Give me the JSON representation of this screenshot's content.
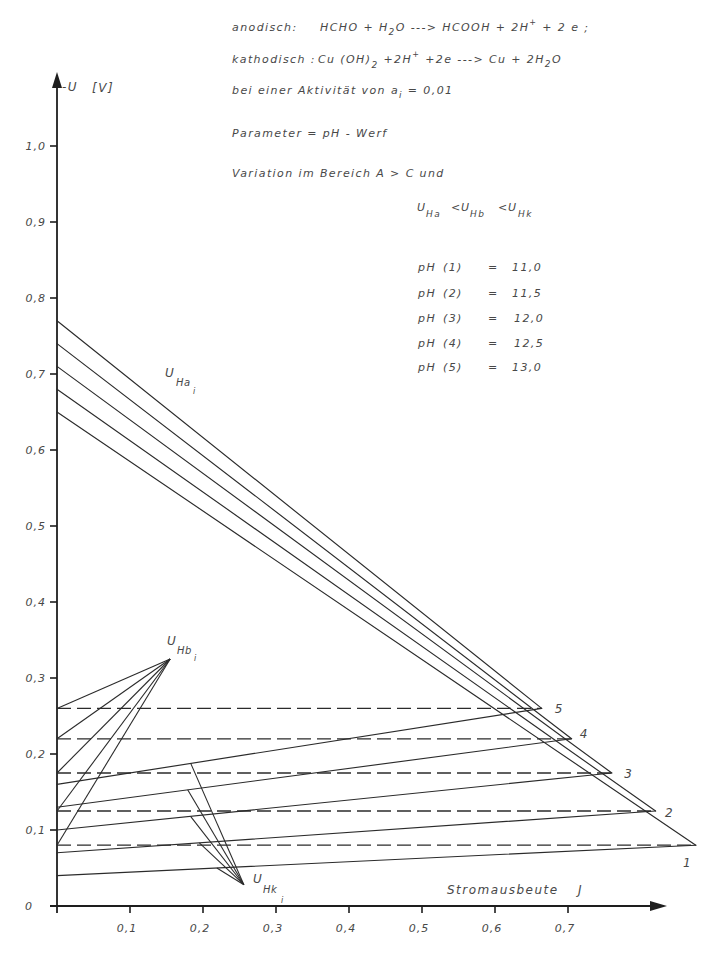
{
  "header": {
    "anodic": {
      "label": "anodisch:",
      "p1": "HCHO + H",
      "s1": "2",
      "p2": "O ---> HCOOH + 2H",
      "sup1": "+",
      "p3": " + 2 e ;"
    },
    "cathodic": {
      "label": "kathodisch :",
      "p1": "Cu (OH)",
      "s1": "2",
      "p2": " +2H",
      "sup1": "+",
      "p3": " +2e ---> Cu + 2H",
      "s2": "2",
      "p4": "O"
    },
    "activity": {
      "p1": "bei einer Aktivität von a",
      "s1": "i",
      "p2": " = 0,01"
    },
    "parameter": "Parameter = pH - Werf",
    "variation": "Variation im Bereich A > C und",
    "order": {
      "u1": "U",
      "s1": "Ha",
      "op1": "<",
      "u2": "U",
      "s2": "Hb",
      "op2": "<",
      "u3": "U",
      "s3": "Hk"
    }
  },
  "ph_table": [
    {
      "label": "pH",
      "index": "(1)",
      "eq": "=",
      "value": "11,0"
    },
    {
      "label": "pH",
      "index": "(2)",
      "eq": "=",
      "value": "11,5"
    },
    {
      "label": "pH",
      "index": "(3)",
      "eq": "=",
      "value": "12,0"
    },
    {
      "label": "pH",
      "index": "(4)",
      "eq": "=",
      "value": "12,5"
    },
    {
      "label": "pH",
      "index": "(5)",
      "eq": "=",
      "value": "13,0"
    }
  ],
  "chart_data": {
    "type": "line",
    "title": "",
    "xlabel": "Stromausbeute J",
    "xlabel_parts": {
      "text": "Stromausbeute",
      "symbol": "J"
    },
    "ylabel": "-U [V]",
    "ylabel_parts": {
      "symbol": "-U",
      "unit": "[V]"
    },
    "origin_label": "0",
    "xlim": [
      0,
      0.83
    ],
    "ylim": [
      0,
      1.09
    ],
    "grid": false,
    "legend": null,
    "x_ticks": [
      {
        "v": 0.1,
        "label": "0,1"
      },
      {
        "v": 0.2,
        "label": "0,2"
      },
      {
        "v": 0.3,
        "label": "0,3"
      },
      {
        "v": 0.4,
        "label": "0,4"
      },
      {
        "v": 0.5,
        "label": "0,5"
      },
      {
        "v": 0.6,
        "label": "0,6"
      },
      {
        "v": 0.7,
        "label": "0,7"
      }
    ],
    "y_ticks": [
      {
        "v": 0.1,
        "label": "0,1"
      },
      {
        "v": 0.2,
        "label": "0,2"
      },
      {
        "v": 0.3,
        "label": "0,3"
      },
      {
        "v": 0.4,
        "label": "0,4"
      },
      {
        "v": 0.5,
        "label": "0,5"
      },
      {
        "v": 0.6,
        "label": "0,6"
      },
      {
        "v": 0.7,
        "label": "0,7"
      },
      {
        "v": 0.8,
        "label": "0,8"
      },
      {
        "v": 0.9,
        "label": "0,9"
      },
      {
        "v": 1.0,
        "label": "1,0"
      }
    ],
    "curve_labels": {
      "U_Ha": {
        "main": "U",
        "sub": "Ha",
        "index": "i"
      },
      "U_Hb": {
        "main": "U",
        "sub": "Hb",
        "index": "i"
      },
      "U_Hk": {
        "main": "U",
        "sub": "Hk",
        "index": "i"
      }
    },
    "series": [
      {
        "name": "U_Ha (1) pH 11,0",
        "key": "u-ha-1",
        "group": "U_Ha",
        "style": "solid",
        "points": [
          [
            0,
            0.65
          ],
          [
            0.875,
            0.08
          ]
        ]
      },
      {
        "name": "U_Ha (2) pH 11,5",
        "key": "u-ha-2",
        "group": "U_Ha",
        "style": "solid",
        "points": [
          [
            0,
            0.68
          ],
          [
            0.82,
            0.125
          ]
        ]
      },
      {
        "name": "U_Ha (3) pH 12,0",
        "key": "u-ha-3",
        "group": "U_Ha",
        "style": "solid",
        "points": [
          [
            0,
            0.71
          ],
          [
            0.76,
            0.175
          ]
        ]
      },
      {
        "name": "U_Ha (4) pH 12,5",
        "key": "u-ha-4",
        "group": "U_Ha",
        "style": "solid",
        "points": [
          [
            0,
            0.74
          ],
          [
            0.705,
            0.22
          ]
        ]
      },
      {
        "name": "U_Ha (5) pH 13,0",
        "key": "u-ha-5",
        "group": "U_Ha",
        "style": "solid",
        "points": [
          [
            0,
            0.77
          ],
          [
            0.664,
            0.26
          ]
        ]
      },
      {
        "name": "U_Hk (1) pH 11,0",
        "key": "u-hk-1",
        "group": "U_Hk",
        "style": "solid",
        "points": [
          [
            0,
            0.04
          ],
          [
            0.875,
            0.08
          ]
        ]
      },
      {
        "name": "U_Hk (2) pH 11,5",
        "key": "u-hk-2",
        "group": "U_Hk",
        "style": "solid",
        "points": [
          [
            0,
            0.07
          ],
          [
            0.82,
            0.125
          ]
        ]
      },
      {
        "name": "U_Hk (3) pH 12,0",
        "key": "u-hk-3",
        "group": "U_Hk",
        "style": "solid",
        "points": [
          [
            0,
            0.1
          ],
          [
            0.76,
            0.175
          ]
        ]
      },
      {
        "name": "U_Hk (4) pH 12,5",
        "key": "u-hk-4",
        "group": "U_Hk",
        "style": "solid",
        "points": [
          [
            0,
            0.13
          ],
          [
            0.705,
            0.22
          ]
        ]
      },
      {
        "name": "U_Hk (5) pH 13,0",
        "key": "u-hk-5",
        "group": "U_Hk",
        "style": "solid",
        "points": [
          [
            0,
            0.16
          ],
          [
            0.664,
            0.26
          ]
        ]
      },
      {
        "name": "U_Hb (1) pH 11,0",
        "key": "u-hb-1",
        "group": "U_Hb",
        "style": "dashed",
        "points": [
          [
            0,
            0.08
          ],
          [
            0.875,
            0.08
          ]
        ]
      },
      {
        "name": "U_Hb (2) pH 11,5",
        "key": "u-hb-2",
        "group": "U_Hb",
        "style": "dashed",
        "points": [
          [
            0,
            0.125
          ],
          [
            0.82,
            0.125
          ]
        ]
      },
      {
        "name": "U_Hb (3) pH 12,0",
        "key": "u-hb-3",
        "group": "U_Hb",
        "style": "dashed",
        "points": [
          [
            0,
            0.175
          ],
          [
            0.76,
            0.175
          ]
        ]
      },
      {
        "name": "U_Hb (4) pH 12,5",
        "key": "u-hb-4",
        "group": "U_Hb",
        "style": "dashed",
        "points": [
          [
            0,
            0.22
          ],
          [
            0.705,
            0.22
          ]
        ]
      },
      {
        "name": "U_Hb (5) pH 13,0",
        "key": "u-hb-5",
        "group": "U_Hb",
        "style": "dashed",
        "points": [
          [
            0,
            0.26
          ],
          [
            0.664,
            0.26
          ]
        ]
      }
    ],
    "tip_labels": [
      {
        "text": "1",
        "at": [
          0.8575,
          0.051
        ]
      },
      {
        "text": "2",
        "at": [
          0.833,
          0.117
        ]
      },
      {
        "text": "3",
        "at": [
          0.777,
          0.168
        ]
      },
      {
        "text": "4",
        "at": [
          0.716,
          0.221
        ]
      },
      {
        "text": "5",
        "at": [
          0.682,
          0.254
        ]
      }
    ],
    "leaders": {
      "U_Hb": {
        "target": [
          0.155,
          0.325
        ],
        "from": [
          [
            0,
            0.26
          ],
          [
            0,
            0.22
          ],
          [
            0,
            0.175
          ],
          [
            0,
            0.125
          ],
          [
            0,
            0.08
          ]
        ]
      },
      "U_Hk": {
        "target": [
          0.256,
          0.028
        ],
        "from": [
          [
            0.183,
            0.188
          ],
          [
            0.179,
            0.153
          ],
          [
            0.183,
            0.118
          ],
          [
            0.195,
            0.083
          ],
          [
            0.219,
            0.05
          ]
        ]
      }
    }
  }
}
